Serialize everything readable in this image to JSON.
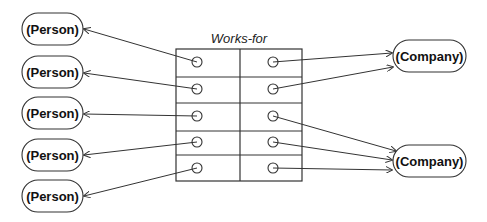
{
  "diagram": {
    "table": {
      "title": "Works-for",
      "x": 176,
      "y": 49,
      "width": 126,
      "height": 132,
      "column_divider_x": 240,
      "row_lines_y": [
        77,
        103,
        131,
        155
      ],
      "left_dots": [
        [
          197,
          62
        ],
        [
          197,
          89
        ],
        [
          197,
          116
        ],
        [
          197,
          142
        ],
        [
          197,
          168
        ]
      ],
      "right_dots": [
        [
          273,
          62
        ],
        [
          273,
          89
        ],
        [
          273,
          116
        ],
        [
          273,
          142
        ],
        [
          273,
          168
        ]
      ]
    },
    "persons": [
      {
        "label": "(Person)",
        "x": 22,
        "y": 13,
        "w": 61,
        "h": 32
      },
      {
        "label": "(Person)",
        "x": 22,
        "y": 56,
        "w": 61,
        "h": 32
      },
      {
        "label": "(Person)",
        "x": 22,
        "y": 97,
        "w": 61,
        "h": 32
      },
      {
        "label": "(Person)",
        "x": 22,
        "y": 139,
        "w": 61,
        "h": 32
      },
      {
        "label": "(Person)",
        "x": 22,
        "y": 180,
        "w": 61,
        "h": 32
      }
    ],
    "companies": [
      {
        "label": "(Company)",
        "x": 393,
        "y": 40,
        "w": 73,
        "h": 32
      },
      {
        "label": "(Company)",
        "x": 393,
        "y": 145,
        "w": 73,
        "h": 32
      }
    ],
    "left_arrows": [
      {
        "from": [
          197,
          62
        ],
        "to": [
          84,
          29
        ]
      },
      {
        "from": [
          197,
          89
        ],
        "to": [
          84,
          73
        ]
      },
      {
        "from": [
          197,
          116
        ],
        "to": [
          84,
          114
        ]
      },
      {
        "from": [
          197,
          142
        ],
        "to": [
          84,
          155
        ]
      },
      {
        "from": [
          197,
          168
        ],
        "to": [
          84,
          196
        ]
      }
    ],
    "right_arrows": [
      {
        "from": [
          273,
          62
        ],
        "to": [
          392,
          53
        ]
      },
      {
        "from": [
          273,
          89
        ],
        "to": [
          393,
          67
        ]
      },
      {
        "from": [
          273,
          116
        ],
        "to": [
          396,
          151
        ]
      },
      {
        "from": [
          273,
          142
        ],
        "to": [
          392,
          160
        ]
      },
      {
        "from": [
          273,
          168
        ],
        "to": [
          392,
          170
        ]
      }
    ],
    "colors": {
      "stroke": "#333333",
      "text": "#111111",
      "background": "#ffffff"
    }
  }
}
